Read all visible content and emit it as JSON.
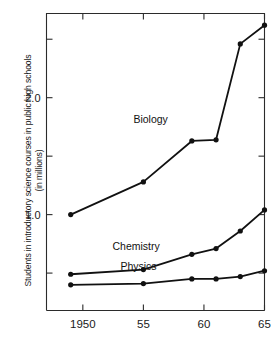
{
  "chart_data": {
    "type": "line",
    "title": "",
    "xlabel": "",
    "ylabel": "Students in introductory science courses in public high schools\n(in millions)",
    "ylabel_line1": "Students in introductory science courses in public high schools",
    "ylabel_line2": "(in millions)",
    "x": [
      1949,
      1955,
      1959,
      1961,
      1963,
      1965
    ],
    "xlim": [
      1947,
      1965
    ],
    "ylim": [
      0.18,
      2.72
    ],
    "grid": false,
    "legend_position": "inline-labels",
    "y_major_ticks": [
      {
        "value": 1.0,
        "label": "1.0"
      },
      {
        "value": 2.0,
        "label": "2.0"
      }
    ],
    "y_minor_ticks": [
      {
        "value": 0.5,
        "label": ""
      },
      {
        "value": 1.5,
        "label": ""
      },
      {
        "value": 2.5,
        "label": ""
      }
    ],
    "x_ticks": [
      {
        "value": 1950,
        "label": "1950"
      },
      {
        "value": 1955,
        "label": "55"
      },
      {
        "value": 1960,
        "label": "60"
      },
      {
        "value": 1965,
        "label": "65"
      }
    ],
    "series": [
      {
        "name": "Biology",
        "label": "Biology",
        "color": "#111111",
        "label_x": 1955.6,
        "label_y": 1.78,
        "values": [
          1.0,
          1.28,
          1.63,
          1.64,
          2.46,
          2.62
        ]
      },
      {
        "name": "Chemistry",
        "label": "Chemistry",
        "color": "#111111",
        "label_x": 1954.4,
        "label_y": 0.7,
        "values": [
          0.49,
          0.53,
          0.66,
          0.71,
          0.86,
          1.04
        ]
      },
      {
        "name": "Physics",
        "label": "Physics",
        "color": "#111111",
        "label_x": 1954.6,
        "label_y": 0.53,
        "values": [
          0.4,
          0.41,
          0.45,
          0.45,
          0.47,
          0.52
        ]
      }
    ]
  }
}
